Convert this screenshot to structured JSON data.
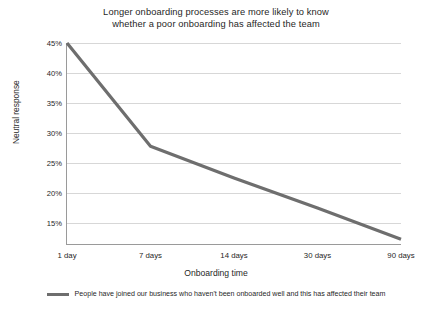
{
  "chart_data": {
    "type": "line",
    "title": "Longer onboarding processes are more likely to know whether a poor onboarding has affected the team",
    "title_lines": [
      "Longer onboarding processes are more likely to know",
      "whether a poor onboarding has affected the team"
    ],
    "xlabel": "Onboarding time",
    "ylabel": "Neutral response",
    "categories": [
      "1 day",
      "7 days",
      "14 days",
      "30 days",
      "90 days"
    ],
    "values": [
      45.0,
      27.8,
      22.5,
      17.5,
      12.3
    ],
    "series": [
      {
        "name": "People have joined our business who haven't been onboarded well and this has affected their team",
        "values": [
          45.0,
          27.8,
          22.5,
          17.5,
          12.3
        ],
        "color": "#6e6e6e"
      }
    ],
    "ylim": [
      11.5,
      45.0
    ],
    "yticks": [
      45,
      40,
      35,
      30,
      25,
      20,
      15
    ],
    "ytick_labels": [
      "45%",
      "40%",
      "35%",
      "30%",
      "25%",
      "20%",
      "15%"
    ],
    "grid": "horizontal",
    "legend_position": "bottom",
    "value_suffix": "%"
  },
  "legend": {
    "label": "People have joined our business who haven't been onboarded well and this has affected their team"
  },
  "colors": {
    "line": "#6e6e6e",
    "grid": "#d7d7d7",
    "axis": "#9a9a9a",
    "text": "#1f1f1f",
    "background": "#ffffff"
  }
}
